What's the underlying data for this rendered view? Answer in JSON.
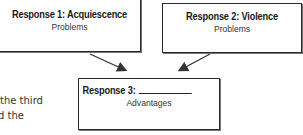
{
  "diagram": {
    "boxes": [
      {
        "id": "response-1",
        "title": "Response 1: Acquiescence",
        "subtitle": "Problems"
      },
      {
        "id": "response-2",
        "title": "Response 2: Violence",
        "subtitle": "Problems"
      },
      {
        "id": "response-3",
        "title": "Response 3:",
        "blank": "__________",
        "subtitle": "Advantages"
      }
    ],
    "arrows": [
      {
        "from": "response-1",
        "to": "response-3"
      },
      {
        "from": "response-2",
        "to": "response-3"
      }
    ]
  },
  "body_text": {
    "line1": "the third",
    "line2": "d the"
  }
}
